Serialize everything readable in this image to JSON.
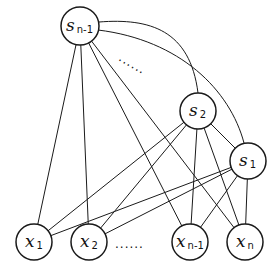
{
  "diagram": {
    "nodes": [
      {
        "id": "s_n-1",
        "main": "s",
        "sub": "n-1",
        "cx": 80,
        "cy": 26,
        "r": 19
      },
      {
        "id": "s_2",
        "main": "s",
        "sub": "2",
        "cx": 198,
        "cy": 111,
        "r": 18
      },
      {
        "id": "s_1",
        "main": "s",
        "sub": "1",
        "cx": 248,
        "cy": 161,
        "r": 18
      },
      {
        "id": "x_1",
        "main": "x",
        "sub": "1",
        "cx": 34,
        "cy": 242,
        "r": 18
      },
      {
        "id": "x_2",
        "main": "x",
        "sub": "2",
        "cx": 89,
        "cy": 242,
        "r": 18
      },
      {
        "id": "x_n-1",
        "main": "x",
        "sub": "n-1",
        "cx": 190,
        "cy": 242,
        "r": 18
      },
      {
        "id": "x_n",
        "main": "x",
        "sub": "n",
        "cx": 245,
        "cy": 242,
        "r": 18
      }
    ],
    "edges": [
      {
        "from": "s_n-1",
        "to": "x_1"
      },
      {
        "from": "s_n-1",
        "to": "x_2"
      },
      {
        "from": "s_n-1",
        "to": "x_n-1"
      },
      {
        "from": "s_n-1",
        "to": "x_n"
      },
      {
        "from": "s_2",
        "to": "x_1"
      },
      {
        "from": "s_2",
        "to": "x_2"
      },
      {
        "from": "s_2",
        "to": "x_n-1"
      },
      {
        "from": "s_2",
        "to": "x_n"
      },
      {
        "from": "s_2",
        "to": "s_1"
      },
      {
        "from": "s_1",
        "to": "x_1"
      },
      {
        "from": "s_1",
        "to": "x_2"
      },
      {
        "from": "s_1",
        "to": "x_n-1"
      },
      {
        "from": "s_1",
        "to": "x_n"
      }
    ],
    "curved_edges": [
      {
        "from": "s_n-1",
        "to": "s_2",
        "d": "M99 22 C150 18 190 30 198 93"
      },
      {
        "from": "s_n-1",
        "to": "s_1",
        "d": "M98 30 C180 40 230 90 244 143"
      }
    ],
    "ellipsis_top": {
      "text": "......",
      "x": 118,
      "y": 60,
      "rotate": 30
    },
    "ellipsis_bottom": {
      "text": "......",
      "x": 115,
      "y": 248
    }
  }
}
